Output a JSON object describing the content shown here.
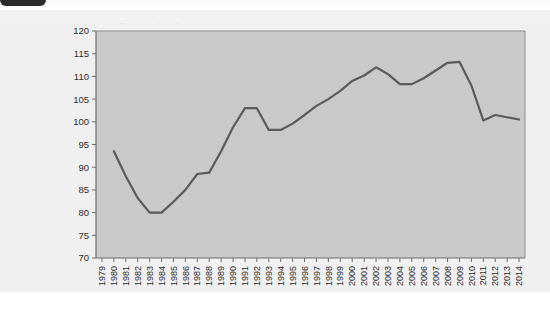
{
  "window": {
    "tab_label": "",
    "doc_header_text": "Figure: index of real output, annual"
  },
  "chart_data": {
    "type": "line",
    "title": "",
    "subtitle": "",
    "xlabel": "",
    "ylabel": "",
    "xlim": [
      1979,
      2014
    ],
    "ylim": [
      70,
      120
    ],
    "ytick_labels": [
      "120",
      "115",
      "110",
      "105",
      "100",
      "95",
      "90",
      "85",
      "80",
      "75",
      "70"
    ],
    "ytick_values": [
      120,
      115,
      110,
      105,
      100,
      95,
      90,
      85,
      80,
      75,
      70
    ],
    "grid": false,
    "legend": "none",
    "line_color": "#5a5a5a",
    "plot_bg_color": "#c9c9c9",
    "figure_bg_color": "#f0f0f0",
    "categories": [
      "1979",
      "1980",
      "1981",
      "1982",
      "1983",
      "1984",
      "1985",
      "1986",
      "1987",
      "1988",
      "1989",
      "1990",
      "1991",
      "1992",
      "1993",
      "1994",
      "1995",
      "1996",
      "1997",
      "1998",
      "1999",
      "2000",
      "2001",
      "2002",
      "2003",
      "2004",
      "2005",
      "2006",
      "2007",
      "2008",
      "2009",
      "2010",
      "2011",
      "2012",
      "2013",
      "2014"
    ],
    "series": [
      {
        "name": "index",
        "values": [
          null,
          93.5,
          88.0,
          83.2,
          80.0,
          80.0,
          82.4,
          85.0,
          88.5,
          88.8,
          93.5,
          98.8,
          103.0,
          103.0,
          98.2,
          98.2,
          99.6,
          101.5,
          103.5,
          105.0,
          106.8,
          109.0,
          110.2,
          112.0,
          110.5,
          108.3,
          108.3,
          109.6,
          111.3,
          113.0,
          113.2,
          108.0,
          100.3,
          101.5,
          101.0,
          100.5
        ]
      }
    ]
  }
}
